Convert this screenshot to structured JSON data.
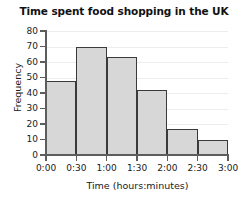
{
  "chart_data": {
    "type": "bar",
    "title": "Time spent food shopping in the UK",
    "xlabel": "Time (hours:minutes)",
    "ylabel": "Frequency",
    "categories": [
      "0:00-0:30",
      "0:30-1:00",
      "1:00-1:30",
      "1:30-2:00",
      "2:00-2:30",
      "2:30-3:00"
    ],
    "values": [
      48,
      70,
      63,
      42,
      17,
      10
    ],
    "bin_edges": [
      "0:00",
      "0:30",
      "1:00",
      "1:30",
      "2:00",
      "2:30",
      "3:00"
    ],
    "x_tick_labels": [
      "0:00",
      "0:30",
      "1:00",
      "1:30",
      "2:00",
      "2:30",
      "3:00"
    ],
    "y_tick_labels": [
      "0",
      "10",
      "20",
      "30",
      "40",
      "50",
      "60",
      "70",
      "80"
    ],
    "y_tick_values": [
      0,
      10,
      20,
      30,
      40,
      50,
      60,
      70,
      80
    ],
    "ylim": [
      0,
      80
    ],
    "grid": "horizontal",
    "legend": "none",
    "bar_fill_color": "#d7d7d7",
    "bar_edge_color": "#3a3a3a",
    "axis_color": "#5d5d5d",
    "gridline_color": "#ededed",
    "background_color": "#ffffff"
  }
}
